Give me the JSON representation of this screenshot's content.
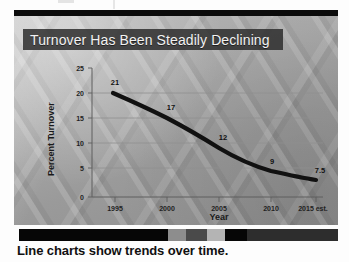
{
  "slide": {
    "title": "Turnover Has Been Steadily Declining"
  },
  "caption": {
    "text": "Line charts show trends over time."
  },
  "colors": {
    "title_band": "#2e2e2e",
    "title_text": "#f2f2f2",
    "line": "#111111",
    "gridline": "#8f8f8f",
    "axis": "#6e6e6e",
    "caption_text": "#101010",
    "top_bar": "#0b0b0b"
  },
  "strip_segments": [
    {
      "name": "segment-black-wide",
      "color": "#060606",
      "width": 149
    },
    {
      "name": "segment-mid-gray",
      "color": "#8d8d8d",
      "width": 18
    },
    {
      "name": "segment-dark-gray",
      "color": "#4a4a4a",
      "width": 21
    },
    {
      "name": "segment-light-gray",
      "color": "#b4b4b4",
      "width": 18
    },
    {
      "name": "segment-black-small",
      "color": "#060606",
      "width": 22
    },
    {
      "name": "segment-charcoal-wide",
      "color": "#2d2d2d",
      "width": 91
    }
  ],
  "chart_data": {
    "type": "line",
    "title": "Turnover Has Been Steadily Declining",
    "xlabel": "Year",
    "ylabel": "Percent Turnover",
    "categories": [
      "1995",
      "2000",
      "2005",
      "2010",
      "2015 est."
    ],
    "values": [
      21,
      17,
      12,
      9,
      7.5
    ],
    "point_labels": [
      "21",
      "17",
      "12",
      "9",
      "7.5"
    ],
    "yticks": [
      0,
      5,
      10,
      15,
      20,
      25
    ],
    "ytick_labels": [
      "0",
      "5",
      "10",
      "15",
      "20",
      "25"
    ],
    "ylim": [
      0,
      25
    ],
    "grid": "horizontal",
    "legend": "none",
    "series": [
      {
        "name": "Percent Turnover",
        "values": [
          21,
          17,
          12,
          9,
          7.5
        ]
      }
    ]
  }
}
